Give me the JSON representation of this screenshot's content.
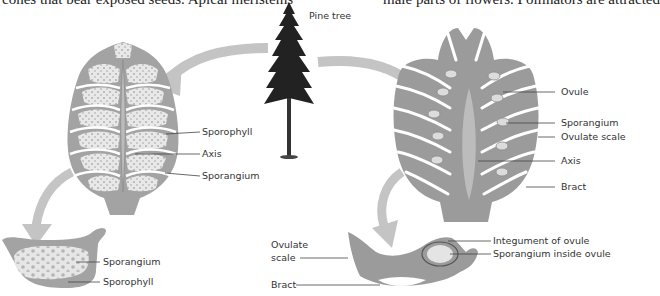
{
  "page_text": {
    "left_fragment": "cones that bear exposed seeds. Apical meristems",
    "right_fragment": "male parts of flowers. Pollinators are attracted"
  },
  "diagram": {
    "title_label": "Pine tree",
    "colors": {
      "cone_fill": "#9b9b9b",
      "cone_light": "#bdbdbd",
      "sporangium_fill": "#e6e6e6",
      "arrow": "#c4c4c4",
      "tree": "#222222",
      "leader_line": "#444444",
      "background": "#ffffff"
    },
    "male_cone": {
      "labels": [
        "Sporophyll",
        "Axis",
        "Sporangium"
      ]
    },
    "male_detail": {
      "labels": [
        "Sporangium",
        "Sporophyll"
      ]
    },
    "female_cone": {
      "labels": [
        "Ovule",
        "Sporangium",
        "Ovulate scale",
        "Axis",
        "Bract"
      ]
    },
    "female_detail": {
      "labels": [
        "Ovulate",
        "scale",
        "Bract",
        "Integument of ovule",
        "Sporangium inside ovule"
      ]
    }
  }
}
